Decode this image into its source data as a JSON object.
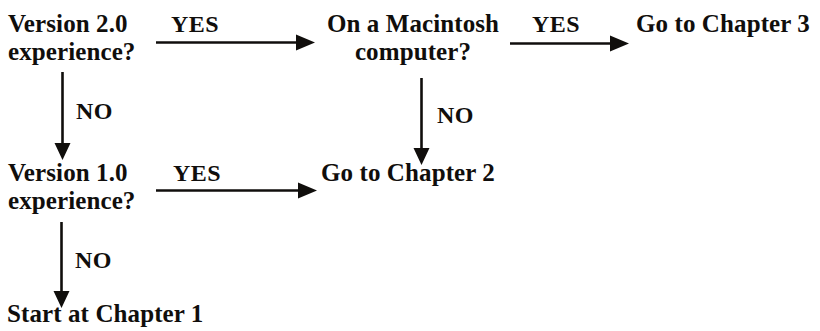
{
  "diagram": {
    "background_color": "#ffffff",
    "ink_color": "#100e0c"
  },
  "nodes": [
    {
      "id": "version-2-question",
      "line1": "Version 2.0",
      "line2": "experience?"
    },
    {
      "id": "macintosh-question",
      "line1": "On a Macintosh",
      "line2": "computer?"
    },
    {
      "id": "goto-chapter-3",
      "line1": "Go to Chapter 3",
      "line2": ""
    },
    {
      "id": "version-1-question",
      "line1": "Version 1.0",
      "line2": "experience?"
    },
    {
      "id": "goto-chapter-2",
      "line1": "Go to Chapter 2",
      "line2": ""
    },
    {
      "id": "start-at-chapter-1",
      "line1": "Start at Chapter 1",
      "line2": ""
    }
  ],
  "edges": [
    {
      "id": "v2-yes-to-mac",
      "label": "YES",
      "direction": "right",
      "from": "version-2-question",
      "to": "macintosh-question"
    },
    {
      "id": "v2-no-to-v1",
      "label": "NO",
      "direction": "down",
      "from": "version-2-question",
      "to": "version-1-question"
    },
    {
      "id": "mac-yes-to-ch3",
      "label": "YES",
      "direction": "right",
      "from": "macintosh-question",
      "to": "goto-chapter-3"
    },
    {
      "id": "mac-no-to-ch2",
      "label": "NO",
      "direction": "down",
      "from": "macintosh-question",
      "to": "goto-chapter-2"
    },
    {
      "id": "v1-yes-to-ch2",
      "label": "YES",
      "direction": "right",
      "from": "version-1-question",
      "to": "goto-chapter-2"
    },
    {
      "id": "v1-no-to-ch1",
      "label": "NO",
      "direction": "down",
      "from": "version-1-question",
      "to": "start-at-chapter-1"
    }
  ]
}
